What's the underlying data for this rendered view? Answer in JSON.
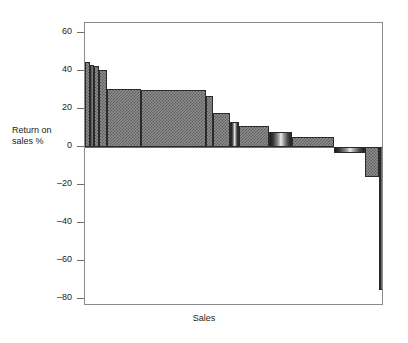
{
  "chart_data": {
    "type": "bar",
    "title": "",
    "subtitle": "",
    "xlabel": "Sales",
    "ylabel": "Return on sales %",
    "orientation": "vertical",
    "grid": false,
    "legend": null,
    "note": "Width-weighted (Marakon-style) profitability bar chart: bar width is proportional to Sales, bar height is Return on sales %.",
    "ylim": [
      -85,
      65
    ],
    "yticks": [
      60,
      40,
      20,
      0,
      -20,
      -40,
      -60,
      -80
    ],
    "ytick_labels": [
      "60",
      "40",
      "20",
      "0",
      "–20",
      "–40",
      "–60",
      "–80"
    ],
    "xticks": [],
    "xtick_labels": [],
    "x_axis_range": [
      0,
      100
    ],
    "x_units": "cumulative share of sales (%)",
    "bars": [
      {
        "index": 1,
        "value": 44.5,
        "x_start": 0.0,
        "x_end": 2.0,
        "fill": "checker"
      },
      {
        "index": 2,
        "value": 43.0,
        "x_start": 2.0,
        "x_end": 4.0,
        "fill": "gradient"
      },
      {
        "index": 3,
        "value": 42.5,
        "x_start": 4.0,
        "x_end": 6.3,
        "fill": "checker"
      },
      {
        "index": 4,
        "value": 40.5,
        "x_start": 6.3,
        "x_end": 9.7,
        "fill": "checker"
      },
      {
        "index": 5,
        "value": 30.5,
        "x_start": 9.7,
        "x_end": 24.7,
        "fill": "checker"
      },
      {
        "index": 6,
        "value": 30.0,
        "x_start": 24.7,
        "x_end": 53.8,
        "fill": "checker"
      },
      {
        "index": 7,
        "value": 27.0,
        "x_start": 53.8,
        "x_end": 56.5,
        "fill": "checker"
      },
      {
        "index": 8,
        "value": 18.0,
        "x_start": 56.5,
        "x_end": 64.2,
        "fill": "checker"
      },
      {
        "index": 9,
        "value": 13.0,
        "x_start": 64.2,
        "x_end": 68.2,
        "fill": "gradient"
      },
      {
        "index": 10,
        "value": 11.0,
        "x_start": 68.2,
        "x_end": 81.3,
        "fill": "checker"
      },
      {
        "index": 11,
        "value": 8.0,
        "x_start": 81.3,
        "x_end": 91.6,
        "fill": "gradient"
      },
      {
        "index": 12,
        "value": 5.5,
        "x_start": 91.6,
        "x_end": 110.4,
        "fill": "checker"
      },
      {
        "index": 13,
        "value": -3.0,
        "x_start": 110.4,
        "x_end": 124.1,
        "fill": "gradient"
      },
      {
        "index": 14,
        "value": -16.0,
        "x_start": 124.1,
        "x_end": 130.4,
        "fill": "checker"
      },
      {
        "index": 15,
        "value": -75.0,
        "x_start": 130.4,
        "x_end": 132.4,
        "fill": "dark"
      }
    ]
  },
  "axis": {
    "y_title_line1": "Return on",
    "y_title_line2": "sales %",
    "x_title": "Sales"
  }
}
